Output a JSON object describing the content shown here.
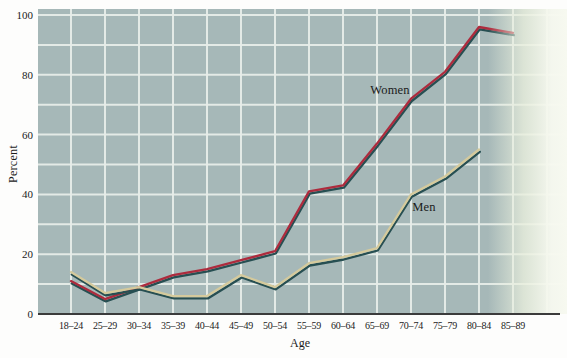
{
  "chart": {
    "y_axis_title": "Percent",
    "x_axis_title": "Age"
  },
  "chart_data": {
    "type": "line",
    "title": "",
    "xlabel": "Age",
    "ylabel": "Percent",
    "categories": [
      "18–24",
      "25–29",
      "30–34",
      "35–39",
      "40–44",
      "45–49",
      "50–54",
      "55–59",
      "60–64",
      "65–69",
      "70–74",
      "75–79",
      "80–84",
      "85–89"
    ],
    "y_ticks": [
      0,
      20,
      40,
      60,
      80,
      100
    ],
    "ylim": [
      0,
      100
    ],
    "grid": {
      "horizontal_interval": 10,
      "vertical": "one white gridline per age category",
      "color": "white"
    },
    "legend_position": "inline-annotations",
    "series": [
      {
        "name": "Women",
        "values": [
          11,
          5,
          9,
          13,
          15,
          18,
          21,
          41,
          43,
          57,
          72,
          81,
          96,
          94
        ]
      },
      {
        "name": "Men",
        "values": [
          14,
          7,
          9,
          6,
          6,
          13,
          9,
          17,
          19,
          22,
          40,
          46,
          55,
          null
        ]
      }
    ],
    "annotations": [
      {
        "text": "Women",
        "x": 390,
        "y": 91
      },
      {
        "text": "Men",
        "x": 424,
        "y": 208
      }
    ],
    "colors": {
      "plot_bg": "#a6b8b8",
      "gridline": "#e7ede9",
      "women_line": "#ad2b3d",
      "men_line": "#d5ca9c",
      "line_shadow": "#274f52",
      "axis": "#3b3b3b",
      "page_fade_mid": "#e9efdd",
      "page_fade_end": "#f7f9f0"
    }
  }
}
